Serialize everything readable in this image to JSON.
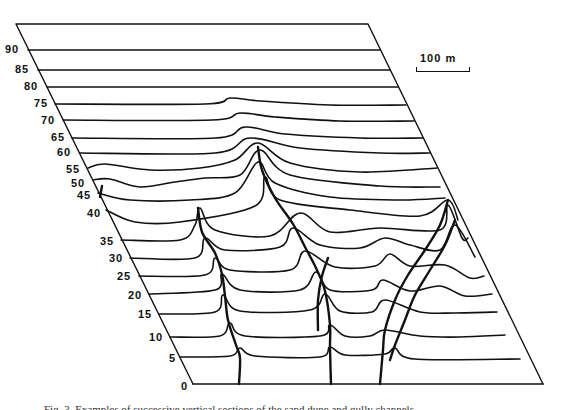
{
  "figure": {
    "scale_bar_label": "100 m",
    "caption_partial": "Fig. 3.  Examples of successive vertical sections of the sand dune and gully channels",
    "frame": {
      "top_left": [
        16,
        24
      ],
      "top_right": [
        368,
        24
      ],
      "bottom_left": [
        193,
        384
      ],
      "bottom_right": [
        543,
        384
      ]
    },
    "colors": {
      "line": "#111111",
      "background": "#ffffff"
    }
  },
  "chart_data": {
    "type": "line",
    "title": "",
    "xlabel": "",
    "ylabel": "Section index",
    "tick_labels": [
      "0",
      "5",
      "10",
      "15",
      "20",
      "25",
      "30",
      "35",
      "40",
      "45",
      "50",
      "55",
      "60",
      "65",
      "70",
      "75",
      "80",
      "85",
      "90"
    ],
    "scale": "100 m",
    "grid": false,
    "series": [
      {
        "name": "90",
        "y": 50,
        "points": [
          [
            28,
            50
          ],
          [
            380,
            50
          ]
        ]
      },
      {
        "name": "85",
        "y": 70,
        "points": [
          [
            38,
            70
          ],
          [
            390,
            70
          ]
        ]
      },
      {
        "name": "80",
        "y": 87,
        "points": [
          [
            47,
            87
          ],
          [
            398,
            87
          ]
        ]
      },
      {
        "name": "75",
        "y": 104,
        "points": [
          [
            55,
            104
          ],
          [
            205,
            104
          ],
          [
            230,
            98
          ],
          [
            260,
            101
          ],
          [
            330,
            105
          ],
          [
            406,
            105
          ]
        ]
      },
      {
        "name": "70",
        "y": 120,
        "points": [
          [
            63,
            120
          ],
          [
            212,
            120
          ],
          [
            240,
            113
          ],
          [
            275,
            117
          ],
          [
            340,
            121
          ],
          [
            414,
            121
          ]
        ]
      },
      {
        "name": "65",
        "y": 138,
        "points": [
          [
            72,
            138
          ],
          [
            215,
            138
          ],
          [
            245,
            127
          ],
          [
            285,
            134
          ],
          [
            360,
            138
          ],
          [
            423,
            138
          ]
        ]
      },
      {
        "name": "60",
        "y": 153,
        "points": [
          [
            80,
            153
          ],
          [
            215,
            153
          ],
          [
            250,
            138
          ],
          [
            300,
            148
          ],
          [
            380,
            153
          ],
          [
            430,
            153
          ]
        ]
      },
      {
        "name": "55",
        "y": 170,
        "points": [
          [
            88,
            168
          ],
          [
            105,
            164
          ],
          [
            150,
            170
          ],
          [
            200,
            168
          ],
          [
            235,
            160
          ],
          [
            258,
            143
          ],
          [
            290,
            163
          ],
          [
            360,
            172
          ],
          [
            437,
            168
          ]
        ]
      },
      {
        "name": "50",
        "y": 183,
        "points": [
          [
            93,
            180
          ],
          [
            110,
            179
          ],
          [
            140,
            187
          ],
          [
            175,
            182
          ],
          [
            205,
            178
          ],
          [
            240,
            175
          ],
          [
            260,
            150
          ],
          [
            290,
            175
          ],
          [
            380,
            186
          ],
          [
            440,
            187
          ]
        ]
      },
      {
        "name": "45",
        "y": 196,
        "points": [
          [
            98,
            193
          ],
          [
            130,
            200
          ],
          [
            190,
            200
          ],
          [
            235,
            193
          ],
          [
            258,
            162
          ],
          [
            275,
            183
          ],
          [
            330,
            197
          ],
          [
            400,
            200
          ],
          [
            445,
            198
          ]
        ]
      },
      {
        "name": "40",
        "y": 213,
        "points": [
          [
            106,
            210
          ],
          [
            135,
            222
          ],
          [
            180,
            222
          ],
          [
            255,
            206
          ],
          [
            265,
            177
          ],
          [
            280,
            200
          ],
          [
            350,
            210
          ],
          [
            420,
            216
          ],
          [
            448,
            200
          ],
          [
            458,
            220
          ]
        ]
      },
      {
        "name": "35",
        "y": 241,
        "points": [
          [
            121,
            240
          ],
          [
            180,
            240
          ],
          [
            195,
            225
          ],
          [
            200,
            208
          ],
          [
            215,
            230
          ],
          [
            270,
            236
          ],
          [
            300,
            213
          ],
          [
            330,
            232
          ],
          [
            380,
            228
          ],
          [
            440,
            230
          ],
          [
            448,
            205
          ],
          [
            462,
            238
          ],
          [
            468,
            238
          ]
        ]
      },
      {
        "name": "30",
        "y": 258,
        "points": [
          [
            130,
            258
          ],
          [
            195,
            258
          ],
          [
            205,
            238
          ],
          [
            225,
            250
          ],
          [
            280,
            247
          ],
          [
            293,
            228
          ],
          [
            320,
            245
          ],
          [
            360,
            248
          ],
          [
            385,
            238
          ],
          [
            410,
            245
          ],
          [
            440,
            250
          ],
          [
            455,
            225
          ],
          [
            475,
            257
          ]
        ]
      },
      {
        "name": "25",
        "y": 276,
        "points": [
          [
            139,
            276
          ],
          [
            205,
            275
          ],
          [
            215,
            258
          ],
          [
            230,
            270
          ],
          [
            290,
            270
          ],
          [
            305,
            251
          ],
          [
            335,
            267
          ],
          [
            375,
            266
          ],
          [
            390,
            254
          ],
          [
            410,
            266
          ],
          [
            445,
            265
          ],
          [
            470,
            278
          ],
          [
            484,
            276
          ]
        ]
      },
      {
        "name": "20",
        "y": 294,
        "points": [
          [
            149,
            294
          ],
          [
            215,
            290
          ],
          [
            222,
            274
          ],
          [
            240,
            290
          ],
          [
            300,
            290
          ],
          [
            316,
            272
          ],
          [
            330,
            290
          ],
          [
            372,
            290
          ],
          [
            383,
            280
          ],
          [
            410,
            291
          ],
          [
            440,
            286
          ],
          [
            465,
            296
          ],
          [
            492,
            294
          ]
        ]
      },
      {
        "name": "15",
        "y": 314,
        "points": [
          [
            159,
            314
          ],
          [
            215,
            312
          ],
          [
            223,
            295
          ],
          [
            240,
            311
          ],
          [
            310,
            310
          ],
          [
            325,
            294
          ],
          [
            340,
            311
          ],
          [
            372,
            312
          ],
          [
            385,
            300
          ],
          [
            420,
            312
          ],
          [
            455,
            313
          ],
          [
            497,
            312
          ]
        ]
      },
      {
        "name": "10",
        "y": 337,
        "points": [
          [
            170,
            337
          ],
          [
            220,
            336
          ],
          [
            230,
            323
          ],
          [
            245,
            336
          ],
          [
            320,
            336
          ],
          [
            330,
            325
          ],
          [
            345,
            336
          ],
          [
            370,
            336
          ],
          [
            385,
            330
          ],
          [
            420,
            336
          ],
          [
            460,
            337
          ],
          [
            505,
            335
          ]
        ]
      },
      {
        "name": "5",
        "y": 357,
        "points": [
          [
            180,
            357
          ],
          [
            230,
            356
          ],
          [
            240,
            348
          ],
          [
            255,
            356
          ],
          [
            320,
            357
          ],
          [
            330,
            347
          ],
          [
            345,
            355
          ],
          [
            385,
            354
          ],
          [
            395,
            348
          ],
          [
            415,
            359
          ],
          [
            520,
            359
          ]
        ]
      },
      {
        "name": "0",
        "y": 384,
        "points": [
          [
            193,
            384
          ],
          [
            543,
            384
          ]
        ]
      }
    ],
    "ridge_traces": [
      {
        "name": "ridge-a",
        "points": [
          [
            258,
            147
          ],
          [
            262,
            170
          ],
          [
            275,
            198
          ],
          [
            293,
            224
          ],
          [
            305,
            247
          ],
          [
            316,
            268
          ],
          [
            325,
            291
          ],
          [
            330,
            325
          ],
          [
            330,
            348
          ],
          [
            331,
            384
          ]
        ]
      },
      {
        "name": "ridge-b",
        "points": [
          [
            198,
            208
          ],
          [
            202,
            232
          ],
          [
            215,
            253
          ],
          [
            222,
            274
          ],
          [
            225,
            296
          ],
          [
            228,
            320
          ],
          [
            236,
            345
          ],
          [
            240,
            358
          ],
          [
            239,
            384
          ]
        ]
      },
      {
        "name": "ridge-c",
        "points": [
          [
            328,
            258
          ],
          [
            322,
            276
          ],
          [
            318,
            300
          ],
          [
            318,
            330
          ]
        ]
      },
      {
        "name": "ridge-d",
        "points": [
          [
            448,
            200
          ],
          [
            440,
            225
          ],
          [
            425,
            250
          ],
          [
            408,
            275
          ],
          [
            395,
            300
          ],
          [
            385,
            330
          ],
          [
            383,
            350
          ],
          [
            380,
            384
          ]
        ]
      },
      {
        "name": "ridge-e",
        "points": [
          [
            455,
            220
          ],
          [
            445,
            245
          ],
          [
            430,
            270
          ],
          [
            415,
            295
          ],
          [
            405,
            320
          ],
          [
            395,
            345
          ],
          [
            390,
            360
          ]
        ]
      },
      {
        "name": "ridge-f",
        "points": [
          [
            102,
            186
          ],
          [
            100,
            197
          ]
        ]
      }
    ]
  },
  "labels": [
    {
      "text": "90",
      "x": 5,
      "y": 44
    },
    {
      "text": "85",
      "x": 15,
      "y": 64
    },
    {
      "text": "80",
      "x": 24,
      "y": 81
    },
    {
      "text": "75",
      "x": 34,
      "y": 98
    },
    {
      "text": "70",
      "x": 41,
      "y": 115
    },
    {
      "text": "65",
      "x": 51,
      "y": 132
    },
    {
      "text": "60",
      "x": 57,
      "y": 147
    },
    {
      "text": "55",
      "x": 66,
      "y": 164
    },
    {
      "text": "50",
      "x": 71,
      "y": 178
    },
    {
      "text": "45",
      "x": 77,
      "y": 190
    },
    {
      "text": "40",
      "x": 87,
      "y": 208
    },
    {
      "text": "35",
      "x": 100,
      "y": 236
    },
    {
      "text": "30",
      "x": 109,
      "y": 253
    },
    {
      "text": "25",
      "x": 117,
      "y": 271
    },
    {
      "text": "20",
      "x": 128,
      "y": 290
    },
    {
      "text": "15",
      "x": 138,
      "y": 309
    },
    {
      "text": "10",
      "x": 149,
      "y": 332
    },
    {
      "text": "5",
      "x": 169,
      "y": 353
    },
    {
      "text": "0",
      "x": 181,
      "y": 381
    }
  ]
}
